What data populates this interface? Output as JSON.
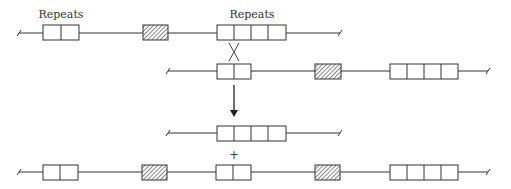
{
  "labels": {
    "left_repeats": "Repeats",
    "right_repeats": "Repeats",
    "plus": "+"
  },
  "colors": {
    "line": "#333333",
    "box_fill": "#ffffff",
    "hatch": "#555555",
    "background": "#ffffff"
  },
  "rows": [
    {
      "name": "chromosome-1",
      "elements": [
        "repeat-2",
        "hatched-marker",
        "repeat-4"
      ]
    },
    {
      "name": "chromosome-2",
      "elements": [
        "repeat-2",
        "hatched-marker",
        "repeat-4"
      ]
    },
    {
      "name": "product-circle-or-fragment",
      "elements": [
        "repeat-4"
      ]
    },
    {
      "name": "product-chromosome",
      "elements": [
        "repeat-2",
        "hatched-marker",
        "repeat-2",
        "hatched-marker",
        "repeat-4"
      ]
    }
  ],
  "symbols": {
    "crossover": "X",
    "arrow": "down-arrow"
  }
}
